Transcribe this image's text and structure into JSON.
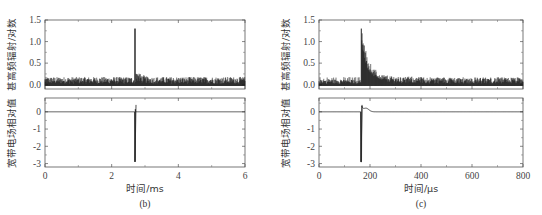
{
  "chart_data": [
    {
      "type": "line",
      "panel_label": "(b)",
      "xlabel": "时间/ms",
      "xlim": [
        0,
        6
      ],
      "x_ticks": [
        "0",
        "2",
        "4",
        "6"
      ],
      "subplots": [
        {
          "ylabel": "甚高频辐射/对数",
          "ylim": [
            -0.1,
            1.5
          ],
          "y_ticks": [
            "0.0",
            "0.5",
            "1.0",
            "1.5"
          ],
          "series": [
            {
              "name": "VHF radiation (log)",
              "description": "noise floor ~0.05-0.2 across 0-6 ms, sharp spike at ~2.7 ms reaching ~1.3, fast decay to noise",
              "x": [
                0,
                1,
                2,
                2.68,
                2.7,
                2.75,
                2.85,
                3,
                4,
                5,
                6
              ],
              "y": [
                0.1,
                0.1,
                0.1,
                0.12,
                1.3,
                0.6,
                0.2,
                0.12,
                0.1,
                0.1,
                0.1
              ]
            }
          ]
        },
        {
          "ylabel": "宽带电场相对值",
          "ylim": [
            -3.2,
            0.8
          ],
          "y_ticks": [
            "0",
            "-1",
            "-2",
            "-3"
          ],
          "series": [
            {
              "name": "Broadband E-field (relative)",
              "description": "flat near 0, sharp negative spike to ~-2.9 at ~2.7 ms with small positive overshoot ~0.4",
              "x": [
                0,
                2.68,
                2.7,
                2.71,
                2.73,
                2.8,
                6
              ],
              "y": [
                0,
                0,
                -2.9,
                0.4,
                0.1,
                0,
                0
              ]
            }
          ]
        }
      ]
    },
    {
      "type": "line",
      "panel_label": "(c)",
      "xlabel": "时间/μs",
      "xlim": [
        0,
        800
      ],
      "x_ticks": [
        "0",
        "200",
        "400",
        "600",
        "800"
      ],
      "subplots": [
        {
          "ylabel": "甚高频辐射/对数",
          "ylim": [
            -0.1,
            1.5
          ],
          "y_ticks": [
            "0.0",
            "0.5",
            "1.0",
            "1.5"
          ],
          "series": [
            {
              "name": "VHF radiation (log)",
              "description": "noise ~0.05-0.2 from 0-165 μs, jump to ~1.3 at ~165 μs, exponential-like decay to ~0.2 by ~250 μs, noise thereafter",
              "x": [
                0,
                100,
                164,
                166,
                175,
                190,
                210,
                250,
                300,
                400,
                600,
                800
              ],
              "y": [
                0.1,
                0.1,
                0.1,
                1.3,
                1.0,
                0.6,
                0.35,
                0.2,
                0.15,
                0.12,
                0.12,
                0.12
              ]
            }
          ]
        },
        {
          "ylabel": "宽带电场相对值",
          "ylim": [
            -3.2,
            0.8
          ],
          "y_ticks": [
            "0",
            "-1",
            "-2",
            "-3"
          ],
          "series": [
            {
              "name": "Broadband E-field (relative)",
              "description": "flat ~0, sharp dip to ~-2.9 at ~165 μs, overshoot ~0.4, small hump ~0.2 at ~185 μs, returns to 0 by ~220 μs",
              "x": [
                0,
                160,
                165,
                170,
                175,
                185,
                200,
                220,
                800
              ],
              "y": [
                0,
                0,
                -2.9,
                0.4,
                0.15,
                0.22,
                0.08,
                0,
                0
              ]
            }
          ]
        }
      ]
    }
  ]
}
